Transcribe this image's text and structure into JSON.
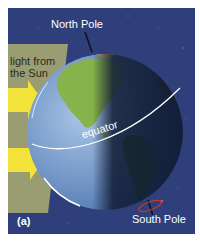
{
  "figure": {
    "panel_label": "(a)",
    "labels": {
      "north_pole": "North Pole",
      "south_pole": "South Pole",
      "sunlight": "light from the Sun",
      "equator": "equator"
    },
    "colors": {
      "background": "#2e3f7c",
      "sunlight_band": "#9a9d72",
      "arrow": "#f2e23a",
      "globe_day": "#6f93c4",
      "globe_night": "#0f1a33",
      "land": "#86b34a",
      "equator_line": "#ffffff",
      "rotation_marker": "#c0392b"
    },
    "arrows": [
      {
        "name": "sun-arrow-upper"
      },
      {
        "name": "sun-arrow-lower"
      }
    ]
  }
}
